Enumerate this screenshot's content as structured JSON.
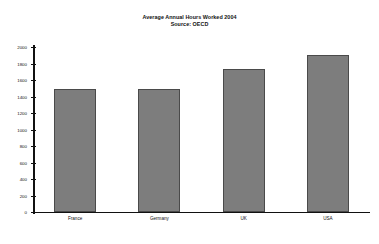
{
  "chart_data": {
    "type": "bar",
    "title": "Average Annual Hours Worked 2004",
    "subtitle": "Source: OECD",
    "xlabel": "",
    "ylabel": "",
    "categories": [
      "France",
      "Germany",
      "UK",
      "USA"
    ],
    "values": [
      1490,
      1495,
      1735,
      1900
    ],
    "series": [
      {
        "name": "Average Annual Hours Worked 2004",
        "values": [
          1490,
          1495,
          1735,
          1900
        ]
      }
    ],
    "ylim": [
      0,
      2000
    ],
    "ytick_labels": [
      "2000",
      "1800",
      "1600",
      "1400",
      "1200",
      "1000",
      "800",
      "600",
      "400",
      "200",
      "0"
    ],
    "ytick_values": [
      2000,
      1800,
      1600,
      1400,
      1200,
      1000,
      800,
      600,
      400,
      200,
      0
    ],
    "grid": false,
    "legend": false,
    "legend_position": "none",
    "bar_color": "#7d7d7d",
    "bar_border_color": "#4a4a4a",
    "axis_color": "#111111",
    "background_color": "#ffffff"
  }
}
